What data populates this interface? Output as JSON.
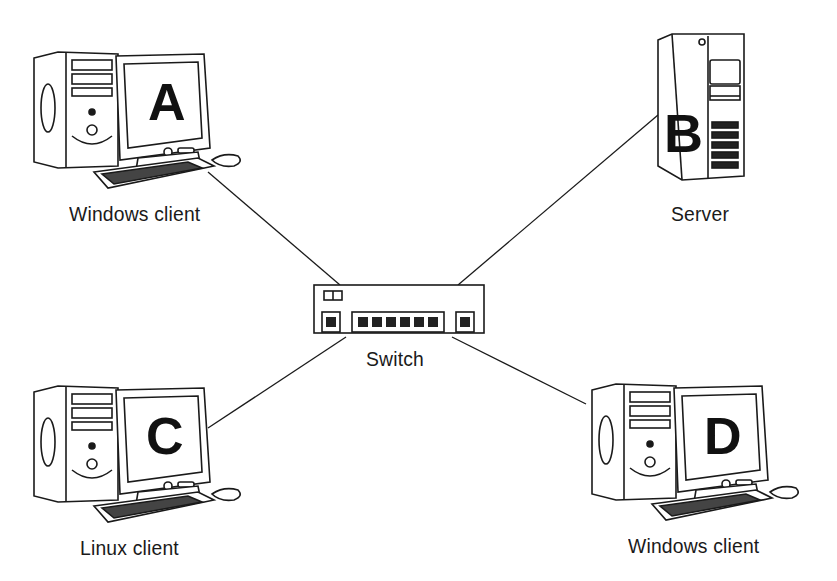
{
  "diagram": {
    "colors": {
      "background": "#ffffff",
      "stroke": "#1a1a1a",
      "fill": "#ffffff",
      "dark": "#222222"
    },
    "nodes": [
      {
        "id": "A",
        "letter": "A",
        "type": "workstation",
        "label": "Windows client"
      },
      {
        "id": "B",
        "letter": "B",
        "type": "server",
        "label": "Server"
      },
      {
        "id": "C",
        "letter": "C",
        "type": "workstation",
        "label": "Linux client"
      },
      {
        "id": "D",
        "letter": "D",
        "type": "workstation",
        "label": "Windows client"
      },
      {
        "id": "switch",
        "type": "switch",
        "label": "Switch"
      }
    ],
    "edges": [
      {
        "from": "A",
        "to": "switch"
      },
      {
        "from": "B",
        "to": "switch"
      },
      {
        "from": "C",
        "to": "switch"
      },
      {
        "from": "D",
        "to": "switch"
      }
    ]
  }
}
